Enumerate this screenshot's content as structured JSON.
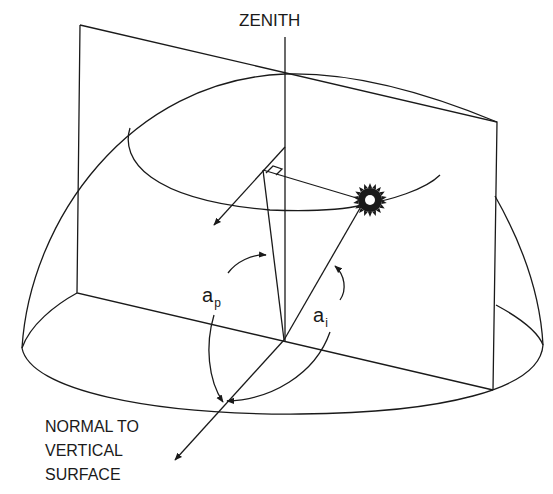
{
  "labels": {
    "zenith": "ZENITH",
    "normal_line1": "NORMAL TO",
    "normal_line2": "VERTICAL",
    "normal_line3": "SURFACE",
    "ap_base": "a",
    "ap_sub": "p",
    "ai_base": "a",
    "ai_sub": "i"
  },
  "colors": {
    "line": "#1a1a1a",
    "background": "#ffffff"
  },
  "icons": {
    "sun": "sun-icon"
  }
}
